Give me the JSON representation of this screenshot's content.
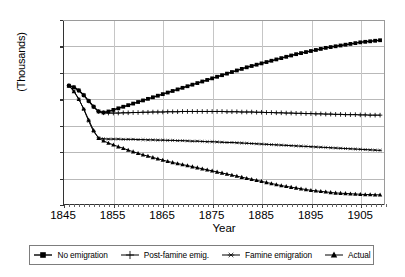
{
  "chart_data": {
    "type": "line",
    "title": "",
    "xlabel": "Year",
    "ylabel": "(Thousands)",
    "xlim": [
      1845,
      1910
    ],
    "ylim": [
      4,
      11
    ],
    "xticks": [
      1845,
      1855,
      1865,
      1875,
      1885,
      1895,
      1905
    ],
    "yticks": [
      4,
      5,
      6,
      7,
      8,
      9,
      10,
      11
    ],
    "grid": true,
    "legend_position": "bottom",
    "x": [
      1846,
      1847,
      1848,
      1849,
      1850,
      1851,
      1852,
      1853,
      1854,
      1855,
      1856,
      1857,
      1858,
      1859,
      1860,
      1861,
      1862,
      1863,
      1864,
      1865,
      1866,
      1867,
      1868,
      1869,
      1870,
      1871,
      1872,
      1873,
      1874,
      1875,
      1876,
      1877,
      1878,
      1879,
      1880,
      1881,
      1882,
      1883,
      1884,
      1885,
      1886,
      1887,
      1888,
      1889,
      1890,
      1891,
      1892,
      1893,
      1894,
      1895,
      1896,
      1897,
      1898,
      1899,
      1900,
      1901,
      1902,
      1903,
      1904,
      1905,
      1906,
      1907,
      1908,
      1909
    ],
    "series": [
      {
        "name": "No emigration",
        "marker": "square",
        "values": [
          8.5,
          8.44,
          8.32,
          8.14,
          7.92,
          7.7,
          7.52,
          7.48,
          7.52,
          7.58,
          7.64,
          7.7,
          7.76,
          7.82,
          7.88,
          7.94,
          8.0,
          8.06,
          8.12,
          8.18,
          8.24,
          8.3,
          8.36,
          8.42,
          8.48,
          8.54,
          8.6,
          8.66,
          8.72,
          8.78,
          8.84,
          8.9,
          8.96,
          9.02,
          9.08,
          9.14,
          9.2,
          9.25,
          9.3,
          9.35,
          9.4,
          9.45,
          9.5,
          9.55,
          9.6,
          9.65,
          9.7,
          9.74,
          9.78,
          9.82,
          9.86,
          9.9,
          9.94,
          9.97,
          10.0,
          10.03,
          10.06,
          10.09,
          10.12,
          10.15,
          10.17,
          10.19,
          10.21,
          10.23
        ]
      },
      {
        "name": "Post-famine emig.",
        "marker": "plus",
        "values": [
          8.5,
          8.44,
          8.32,
          8.14,
          7.92,
          7.7,
          7.52,
          7.47,
          7.46,
          7.46,
          7.46,
          7.47,
          7.47,
          7.48,
          7.48,
          7.49,
          7.49,
          7.5,
          7.5,
          7.5,
          7.51,
          7.51,
          7.51,
          7.52,
          7.52,
          7.52,
          7.52,
          7.52,
          7.52,
          7.52,
          7.52,
          7.52,
          7.51,
          7.51,
          7.51,
          7.5,
          7.5,
          7.5,
          7.49,
          7.49,
          7.48,
          7.48,
          7.47,
          7.47,
          7.46,
          7.46,
          7.45,
          7.45,
          7.44,
          7.44,
          7.43,
          7.43,
          7.42,
          7.42,
          7.41,
          7.41,
          7.4,
          7.4,
          7.4,
          7.39,
          7.39,
          7.38,
          7.38,
          7.38
        ]
      },
      {
        "name": "Famine emigration",
        "marker": "star",
        "values": [
          8.5,
          8.3,
          8.0,
          7.6,
          7.15,
          6.75,
          6.52,
          6.48,
          6.47,
          6.47,
          6.47,
          6.46,
          6.46,
          6.46,
          6.45,
          6.45,
          6.44,
          6.44,
          6.43,
          6.43,
          6.42,
          6.42,
          6.41,
          6.41,
          6.4,
          6.39,
          6.39,
          6.38,
          6.37,
          6.37,
          6.36,
          6.35,
          6.34,
          6.34,
          6.33,
          6.32,
          6.31,
          6.3,
          6.29,
          6.28,
          6.27,
          6.26,
          6.25,
          6.24,
          6.23,
          6.22,
          6.21,
          6.2,
          6.19,
          6.18,
          6.17,
          6.16,
          6.15,
          6.14,
          6.13,
          6.12,
          6.11,
          6.1,
          6.09,
          6.08,
          6.07,
          6.06,
          6.05,
          6.04
        ]
      },
      {
        "name": "Actual",
        "marker": "triangle",
        "values": [
          8.5,
          8.28,
          7.98,
          7.62,
          7.2,
          6.8,
          6.5,
          6.4,
          6.32,
          6.25,
          6.18,
          6.12,
          6.05,
          5.99,
          5.93,
          5.87,
          5.82,
          5.77,
          5.72,
          5.67,
          5.62,
          5.58,
          5.54,
          5.5,
          5.46,
          5.42,
          5.38,
          5.34,
          5.3,
          5.26,
          5.22,
          5.18,
          5.14,
          5.1,
          5.06,
          5.02,
          4.98,
          4.94,
          4.9,
          4.86,
          4.82,
          4.78,
          4.74,
          4.7,
          4.67,
          4.64,
          4.61,
          4.58,
          4.55,
          4.52,
          4.5,
          4.48,
          4.46,
          4.44,
          4.42,
          4.41,
          4.4,
          4.39,
          4.38,
          4.37,
          4.36,
          4.36,
          4.35,
          4.35
        ]
      }
    ]
  },
  "axes": {
    "y_title": "(Thousands)",
    "x_title": "Year",
    "y_tick_labels": [
      "11",
      "10",
      "9",
      "8",
      "7",
      "6",
      "5",
      "4"
    ],
    "x_tick_labels": [
      "1845",
      "1855",
      "1865",
      "1875",
      "1885",
      "1895",
      "1905"
    ]
  },
  "legend": {
    "items": [
      {
        "label": "No emigration",
        "marker": "square"
      },
      {
        "label": "Post-famine emig.",
        "marker": "plus"
      },
      {
        "label": "Famine emigration",
        "marker": "star"
      },
      {
        "label": "Actual",
        "marker": "triangle"
      }
    ]
  },
  "colors": {
    "series": "#000000",
    "grid": "#b9b9b9",
    "axis": "#333333",
    "background": "#ffffff"
  }
}
